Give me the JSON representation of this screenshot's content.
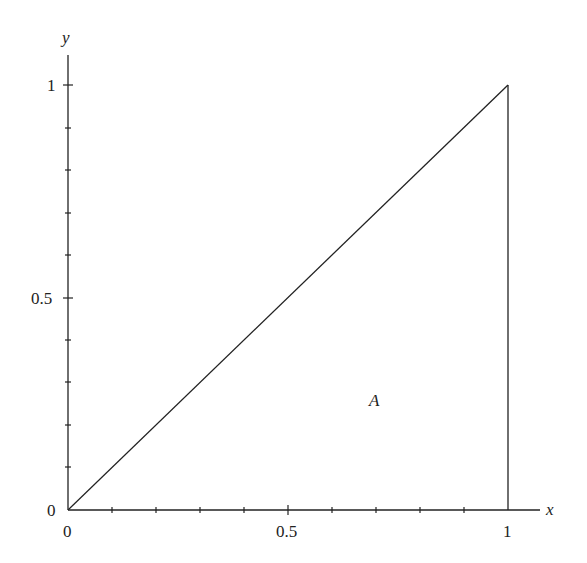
{
  "diagram": {
    "axes": {
      "x_label": "x",
      "y_label": "y",
      "x_ticks": [
        "0",
        "0.5",
        "1"
      ],
      "y_ticks": [
        "0",
        "0.5",
        "1"
      ],
      "x_minor_step": 0.1,
      "y_minor_step": 0.1
    },
    "region_label": "A",
    "shapes": [
      {
        "type": "line",
        "from": [
          0,
          0
        ],
        "to": [
          1,
          1
        ],
        "desc": "diagonal y = x"
      },
      {
        "type": "line",
        "from": [
          1,
          0
        ],
        "to": [
          1,
          1
        ],
        "desc": "vertical line x = 1"
      }
    ],
    "colors": {
      "stroke": "#222222",
      "background": "#ffffff"
    }
  }
}
